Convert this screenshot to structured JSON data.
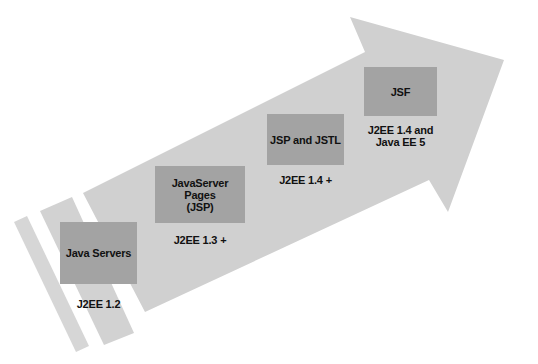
{
  "diagram": {
    "type": "evolution-arrow",
    "colors": {
      "arrow": "#d2d2d2",
      "box": "#a3a3a3",
      "text": "#111111",
      "background": "#ffffff"
    },
    "stages": [
      {
        "label": "Java Servers",
        "version": "J2EE 1.2"
      },
      {
        "label": "JavaServer Pages\n(JSP)",
        "version": "J2EE 1.3 +"
      },
      {
        "label": "JSP and JSTL",
        "version": "J2EE 1.4 +"
      },
      {
        "label": "JSF",
        "version": "J2EE 1.4 and\nJava EE 5"
      }
    ]
  }
}
